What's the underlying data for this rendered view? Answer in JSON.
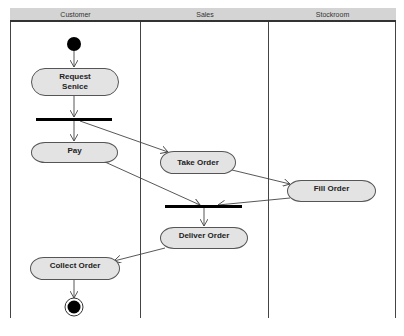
{
  "diagram": {
    "type": "UML activity diagram with swimlanes",
    "lanes": [
      {
        "id": "customer",
        "label": "Customer"
      },
      {
        "id": "sales",
        "label": "Sales"
      },
      {
        "id": "stockroom",
        "label": "Stockroom"
      }
    ],
    "nodes": {
      "start": {
        "type": "initial",
        "lane": "customer"
      },
      "request_service": {
        "type": "activity",
        "label": "Request Senice",
        "lane": "customer"
      },
      "fork": {
        "type": "fork",
        "lane": "customer"
      },
      "pay": {
        "type": "activity",
        "label": "Pay",
        "lane": "customer"
      },
      "take_order": {
        "type": "activity",
        "label": "Take Order",
        "lane": "sales"
      },
      "fill_order": {
        "type": "activity",
        "label": "Fill Order",
        "lane": "stockroom"
      },
      "join": {
        "type": "join",
        "lane": "sales"
      },
      "deliver_order": {
        "type": "activity",
        "label": "Deliver Order",
        "lane": "sales"
      },
      "collect_order": {
        "type": "activity",
        "label": "Collect Order",
        "lane": "customer"
      },
      "end": {
        "type": "final",
        "lane": "customer"
      }
    },
    "edges": [
      [
        "start",
        "request_service"
      ],
      [
        "request_service",
        "fork"
      ],
      [
        "fork",
        "pay"
      ],
      [
        "fork",
        "take_order"
      ],
      [
        "take_order",
        "fill_order"
      ],
      [
        "pay",
        "join"
      ],
      [
        "fill_order",
        "join"
      ],
      [
        "join",
        "deliver_order"
      ],
      [
        "deliver_order",
        "collect_order"
      ],
      [
        "collect_order",
        "end"
      ]
    ],
    "colors": {
      "header_bg": "#d4d4d4",
      "activity_fill": "#e3e3e3",
      "line": "#555555",
      "bar": "#000000"
    }
  }
}
